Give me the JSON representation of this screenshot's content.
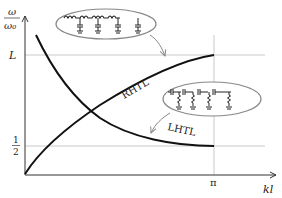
{
  "figure": {
    "y_axis_label_numerator": "ω",
    "y_axis_label_denominator": "ω₀",
    "x_axis_label": "kl",
    "y_ticks": [
      {
        "label": "L",
        "role": "upper-limit"
      },
      {
        "label_numerator": "1",
        "label_denominator": "2",
        "role": "lower-limit"
      }
    ],
    "x_ticks": [
      {
        "label": "π"
      }
    ],
    "curves": [
      {
        "name": "RHTL",
        "label": "RHTL",
        "description": "right-handed transmission line, rising from origin to L at π"
      },
      {
        "name": "LHTL",
        "label": "LHTL",
        "description": "left-handed transmission line, falling from top to 1/2 at π"
      }
    ],
    "insets": [
      {
        "name": "rhtl-circuit",
        "description": "series inductors with shunt capacitors to ground",
        "points_to": "RHTL"
      },
      {
        "name": "lhtl-circuit",
        "description": "series capacitors with shunt inductors to ground",
        "points_to": "LHTL"
      }
    ],
    "colors": {
      "curve": "#111111",
      "axis": "#333333",
      "guide": "#bbbbbb",
      "inset_outline": "#888888"
    }
  }
}
